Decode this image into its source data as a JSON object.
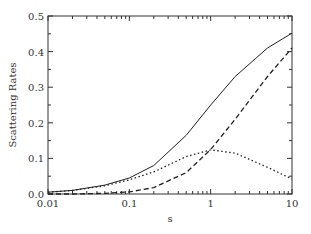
{
  "chart_data": {
    "type": "line",
    "title": "",
    "xlabel": "s",
    "ylabel": "Scattering Rates",
    "xscale": "log",
    "xlim": [
      0.01,
      10
    ],
    "ylim": [
      0,
      0.5
    ],
    "x_ticks": [
      "0.01",
      "0.1",
      "1",
      "10"
    ],
    "y_ticks": [
      "0.0",
      "0.1",
      "0.2",
      "0.3",
      "0.4",
      "0.5"
    ],
    "grid": false,
    "legend": null,
    "x": [
      0.01,
      0.02,
      0.05,
      0.1,
      0.2,
      0.5,
      1,
      2,
      5,
      10
    ],
    "series": [
      {
        "name": "total (solid)",
        "style": "solid",
        "values": [
          0.005,
          0.01,
          0.025,
          0.045,
          0.08,
          0.165,
          0.25,
          0.33,
          0.41,
          0.452
        ]
      },
      {
        "name": "dashed",
        "style": "dashed",
        "values": [
          0.0,
          0.0,
          0.002,
          0.006,
          0.018,
          0.06,
          0.125,
          0.21,
          0.33,
          0.41
        ]
      },
      {
        "name": "dotted",
        "style": "dotted",
        "values": [
          0.005,
          0.01,
          0.023,
          0.04,
          0.062,
          0.105,
          0.124,
          0.115,
          0.075,
          0.042
        ]
      }
    ]
  }
}
